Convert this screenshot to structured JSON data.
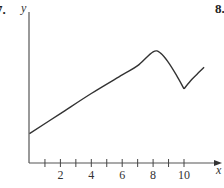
{
  "problem_numbers": {
    "left": "7.",
    "right": "8."
  },
  "chart_data": {
    "type": "line",
    "title": "",
    "xlabel": "x",
    "ylabel": "y",
    "x_ticks": [
      1,
      2,
      3,
      4,
      5,
      6,
      7,
      8,
      9,
      10
    ],
    "x_tick_labels": [
      "2",
      "4",
      "6",
      "8",
      "10"
    ],
    "x_tick_label_values": [
      2,
      4,
      6,
      8,
      10
    ],
    "xlim": [
      0,
      12
    ],
    "ylim": [
      0,
      10
    ],
    "grid": false,
    "series": [
      {
        "name": "y(x)",
        "x": [
          0,
          2,
          4,
          6,
          7,
          8,
          8.5,
          9,
          9.5,
          10,
          10.5,
          11,
          11.3
        ],
        "y": [
          1.9,
          3.2,
          4.5,
          5.7,
          6.3,
          7.2,
          7.1,
          6.5,
          5.7,
          4.8,
          5.4,
          5.9,
          6.2
        ]
      }
    ],
    "annotations": [
      "sharp corner (cusp) at x=10",
      "local max near x=8"
    ]
  }
}
